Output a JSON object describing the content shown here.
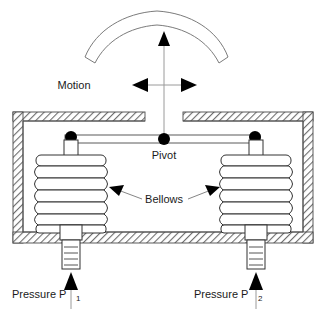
{
  "figure": {
    "background_color": "#ffffff",
    "line_color": "#333333",
    "hatch_color": "#6e6e6e"
  },
  "labels": {
    "motion": "Motion",
    "pivot": "Pivot",
    "bellows": "Bellows",
    "pressure_left_text": "Pressure P",
    "pressure_left_sub": "1",
    "pressure_right_text": "Pressure P",
    "pressure_right_sub": "2"
  },
  "components": {
    "scale_arc": {
      "name": "curved-scale-arc",
      "description": "curved band above housing indicating pointer travel"
    },
    "pointer": {
      "name": "pointer-stem",
      "description": "vertical stem from pivot to arc with upward arrowhead"
    },
    "motion_arrows": {
      "name": "motion-cross-arrows",
      "horizontal": "double-headed left-right arrow",
      "vertical": "upward arrow"
    },
    "housing": {
      "name": "pressure-housing",
      "description": "hatched rectangular enclosure with gap in top wall"
    },
    "beam": {
      "name": "pivot-beam",
      "pivot_count": 3,
      "description": "horizontal beam with pivot dots at both ends and center"
    },
    "bellows_left": {
      "name": "bellows-left",
      "convolutions": 5
    },
    "bellows_right": {
      "name": "bellows-right",
      "convolutions": 5
    },
    "port_left": {
      "name": "pressure-port-left",
      "description": "threaded inlet nozzle feeding left bellows"
    },
    "port_right": {
      "name": "pressure-port-right",
      "description": "threaded inlet nozzle feeding right bellows"
    }
  }
}
